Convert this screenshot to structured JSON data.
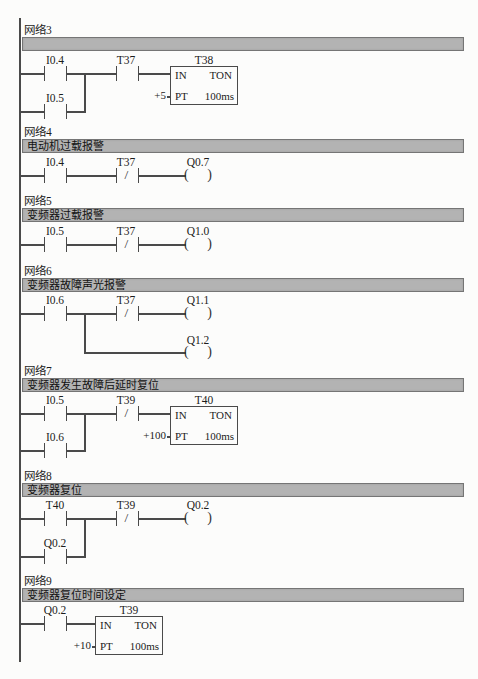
{
  "page": {
    "background": "#fcfcfb",
    "line_color": "#4a4a4a",
    "comment_bar_fill": "#b3b3b3",
    "comment_bar_border": "#757575"
  },
  "networks": [
    {
      "label": "网络3",
      "comment": "",
      "c1": "I0.4",
      "c2": "I0.5",
      "c3": "T37",
      "timer": {
        "name": "T38",
        "in": "IN",
        "type": "TON",
        "pt": "PT",
        "pt_value": "+5",
        "base": "100ms"
      }
    },
    {
      "label": "网络4",
      "comment": "电动机过载报警",
      "c1": "I0.4",
      "c2": "T37",
      "coil": "Q0.7"
    },
    {
      "label": "网络5",
      "comment": "变频器过载报警",
      "c1": "I0.5",
      "c2": "T37",
      "coil": "Q1.0"
    },
    {
      "label": "网络6",
      "comment": "变频器故障声光报警",
      "c1": "I0.6",
      "c2": "T37",
      "coil1": "Q1.1",
      "coil2": "Q1.2"
    },
    {
      "label": "网络7",
      "comment": "变频器发生故障后延时复位",
      "c1": "I0.5",
      "c2": "I0.6",
      "c3": "T39",
      "timer": {
        "name": "T40",
        "in": "IN",
        "type": "TON",
        "pt": "PT",
        "pt_value": "+100",
        "base": "100ms"
      }
    },
    {
      "label": "网络8",
      "comment": "变频器复位",
      "c1": "T40",
      "c2": "Q0.2",
      "c3": "T39",
      "coil": "Q0.2"
    },
    {
      "label": "网络9",
      "comment": "变频器复位时间设定",
      "c1": "Q0.2",
      "timer": {
        "name": "T39",
        "in": "IN",
        "type": "TON",
        "pt": "PT",
        "pt_value": "+10",
        "base": "100ms"
      }
    }
  ]
}
